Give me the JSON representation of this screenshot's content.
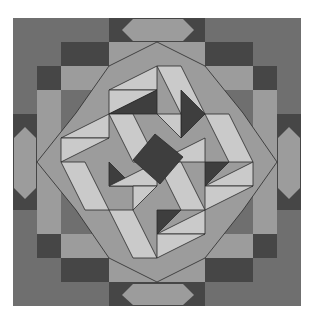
{
  "colors": {
    "background": "#6f6f6f",
    "dark": "#464646",
    "band": "#9c9c9c",
    "light": "#cacaca",
    "center_dark": "#3e3e3e",
    "line": "#2a2a2a"
  },
  "frame": {
    "x": 13,
    "y": 18,
    "size": 288
  },
  "shapes": [
    {
      "name": "dark-step-top-left-1",
      "fill": "dark",
      "points": "61,42 109,42 109,66 61,66"
    },
    {
      "name": "dark-step-top-left-2",
      "fill": "dark",
      "points": "37,66 61,66 61,90 37,90"
    },
    {
      "name": "dark-step-top-right-1",
      "fill": "dark",
      "points": "205,42 253,42 253,66 205,66"
    },
    {
      "name": "dark-step-top-right-2",
      "fill": "dark",
      "points": "253,66 277,66 277,90 253,90"
    },
    {
      "name": "dark-step-bottom-left-1",
      "fill": "dark",
      "points": "61,258 109,258 109,282 61,282"
    },
    {
      "name": "dark-step-bottom-left-2",
      "fill": "dark",
      "points": "37,234 61,234 61,258 37,258"
    },
    {
      "name": "dark-step-bottom-right-1",
      "fill": "dark",
      "points": "205,258 253,258 253,282 205,282"
    },
    {
      "name": "dark-step-bottom-right-2",
      "fill": "dark",
      "points": "253,234 277,234 277,258 253,258"
    },
    {
      "name": "dark-strip-top",
      "fill": "dark",
      "points": "109,18 205,18 205,42 109,42"
    },
    {
      "name": "dark-strip-bottom",
      "fill": "dark",
      "points": "109,282 205,282 205,306 109,306"
    },
    {
      "name": "dark-strip-left",
      "fill": "dark",
      "points": "13,114 37,114 37,210 13,210"
    },
    {
      "name": "dark-strip-right",
      "fill": "dark",
      "points": "277,114 301,114 301,210 277,210"
    },
    {
      "name": "medium-frame-top",
      "fill": "band",
      "points": "109,42 205,42 205,66 109,66"
    },
    {
      "name": "medium-frame-bottom",
      "fill": "band",
      "points": "109,258 205,258 205,282 109,282"
    },
    {
      "name": "medium-frame-left",
      "fill": "band",
      "points": "37,90 61,90 61,234 37,234 37,114"
    },
    {
      "name": "medium-frame-right",
      "fill": "band",
      "points": "253,90 277,90 277,234 253,234"
    },
    {
      "name": "medium-frame-tl",
      "fill": "band",
      "points": "61,66 109,66 109,90 61,90"
    },
    {
      "name": "medium-frame-tr",
      "fill": "band",
      "points": "205,66 253,66 253,90 205,90"
    },
    {
      "name": "medium-frame-bl",
      "fill": "band",
      "points": "61,234 109,234 109,258 61,258"
    },
    {
      "name": "medium-frame-br",
      "fill": "band",
      "points": "205,234 253,234 253,258 205,258"
    },
    {
      "name": "hexagon-top",
      "fill": "band",
      "points": "122,30 133,19 183,19 194,30 183,41 133,41"
    },
    {
      "name": "hexagon-bottom",
      "fill": "band",
      "points": "122,295 133,284 183,284 194,295 183,305 133,305"
    },
    {
      "name": "hexagon-left",
      "fill": "band",
      "points": "25,127 36,138 36,188 25,199 14,188 14,138"
    },
    {
      "name": "hexagon-right",
      "fill": "band",
      "points": "289,127 300,138 300,188 289,199 278,188 278,138"
    },
    {
      "name": "octagon-band",
      "fill": "band",
      "stroke": true,
      "points": "157,42 205,66 243,113 277,162 243,210 205,258 157,282 109,258 76,210 37,162 76,113 109,66"
    },
    {
      "name": "light-tri-1",
      "fill": "light",
      "stroke": true,
      "points": "157,66 109,90 157,90"
    },
    {
      "name": "light-tri-2",
      "fill": "light",
      "stroke": true,
      "points": "109,90 157,90 109,114"
    },
    {
      "name": "light-tri-3",
      "fill": "light",
      "stroke": true,
      "points": "157,66 181,66 205,114 181,114"
    },
    {
      "name": "light-tri-4",
      "fill": "light",
      "stroke": true,
      "points": "205,114 229,114 253,162 229,162"
    },
    {
      "name": "light-tri-5",
      "fill": "light",
      "stroke": true,
      "points": "61,138 109,114 109,138"
    },
    {
      "name": "light-tri-6",
      "fill": "light",
      "stroke": true,
      "points": "61,138 109,138 61,162"
    },
    {
      "name": "light-tri-7",
      "fill": "light",
      "stroke": true,
      "points": "253,162 205,186 253,186"
    },
    {
      "name": "light-tri-8",
      "fill": "light",
      "stroke": true,
      "points": "205,186 253,186 205,210"
    },
    {
      "name": "light-tri-9",
      "fill": "light",
      "stroke": true,
      "points": "61,162 85,162 109,210 85,210"
    },
    {
      "name": "light-tri-10",
      "fill": "light",
      "stroke": true,
      "points": "109,210 133,210 157,258 133,258"
    },
    {
      "name": "light-tri-11",
      "fill": "light",
      "stroke": true,
      "points": "157,234 205,210 205,234"
    },
    {
      "name": "light-tri-12",
      "fill": "light",
      "stroke": true,
      "points": "157,234 205,234 157,258"
    },
    {
      "name": "dark-tri-a",
      "fill": "center_dark",
      "stroke": true,
      "points": "109,114 157,90 157,114"
    },
    {
      "name": "dark-tri-b",
      "fill": "center_dark",
      "stroke": true,
      "points": "181,90 205,114 181,138"
    },
    {
      "name": "dark-tri-c",
      "fill": "center_dark",
      "stroke": true,
      "points": "205,162 229,162 205,186"
    },
    {
      "name": "dark-tri-d",
      "fill": "center_dark",
      "stroke": true,
      "points": "157,210 181,210 157,234"
    },
    {
      "name": "dark-tri-e",
      "fill": "center_dark",
      "stroke": true,
      "points": "109,162 133,186 109,186"
    },
    {
      "name": "light-inner-1",
      "fill": "light",
      "stroke": true,
      "points": "109,114 133,114 157,162 133,162"
    },
    {
      "name": "light-inner-2",
      "fill": "light",
      "stroke": true,
      "points": "205,138 157,162 205,162"
    },
    {
      "name": "light-inner-3",
      "fill": "light",
      "stroke": true,
      "points": "157,162 181,162 205,210 181,210"
    },
    {
      "name": "light-inner-4",
      "fill": "light",
      "stroke": true,
      "points": "157,162 109,186 157,186"
    },
    {
      "name": "light-inner-5",
      "fill": "light",
      "stroke": true,
      "points": "157,114 181,114 181,138"
    },
    {
      "name": "light-inner-6",
      "fill": "light",
      "stroke": true,
      "points": "133,186 157,186 133,210"
    },
    {
      "name": "center-square",
      "fill": "center_dark",
      "stroke": true,
      "points": "155,134 183,157 160,184 133,160"
    }
  ]
}
